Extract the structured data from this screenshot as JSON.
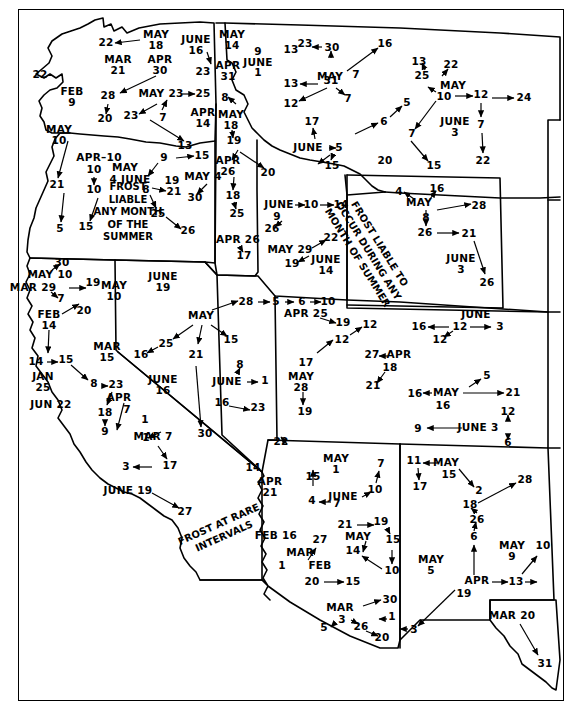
{
  "colors": {
    "ink": "#000000",
    "paper": "#ffffff"
  },
  "notes": {
    "frost_liable_block": "FROST\nLIABLE\nANY MONTH\nOF THE\nSUMMER",
    "frost_liable_rotated": "FROST LIABLE TO\nOCCUR DURING ANY\nMONTH OF SUMMER",
    "frost_rare_rotated": "FROST AT RARE\nINTERVALS"
  },
  "annotations": [
    {
      "id": "a001",
      "text": "22",
      "x": 106,
      "y": 43
    },
    {
      "id": "a002",
      "text": "MAY\n18",
      "x": 156,
      "y": 40
    },
    {
      "id": "a003",
      "text": "JUNE\n16",
      "x": 196,
      "y": 45
    },
    {
      "id": "a004",
      "text": "23",
      "x": 203,
      "y": 72
    },
    {
      "id": "a005",
      "text": "MAY\n14",
      "x": 232,
      "y": 40
    },
    {
      "id": "a006",
      "text": "APR\n31",
      "x": 228,
      "y": 71
    },
    {
      "id": "a007",
      "text": "9\nJUNE\n1",
      "x": 258,
      "y": 62
    },
    {
      "id": "a008",
      "text": "MAR\n21",
      "x": 118,
      "y": 65
    },
    {
      "id": "a009",
      "text": "APR\n30",
      "x": 160,
      "y": 65
    },
    {
      "id": "a010",
      "text": "22",
      "x": 40,
      "y": 75
    },
    {
      "id": "a011",
      "text": "FEB\n9",
      "x": 72,
      "y": 97
    },
    {
      "id": "a012",
      "text": "28",
      "x": 108,
      "y": 96
    },
    {
      "id": "a013",
      "text": "MAY 23",
      "x": 161,
      "y": 94
    },
    {
      "id": "a014",
      "text": "25",
      "x": 203,
      "y": 94
    },
    {
      "id": "a015",
      "text": "20",
      "x": 105,
      "y": 119
    },
    {
      "id": "a016",
      "text": "23",
      "x": 131,
      "y": 116
    },
    {
      "id": "a017",
      "text": "7",
      "x": 163,
      "y": 118
    },
    {
      "id": "a018",
      "text": "APR\n14",
      "x": 203,
      "y": 118
    },
    {
      "id": "a019",
      "text": "MAY\n10",
      "x": 59,
      "y": 135
    },
    {
      "id": "a020",
      "text": "13",
      "x": 185,
      "y": 146
    },
    {
      "id": "a021",
      "text": "APR–10",
      "x": 99,
      "y": 158
    },
    {
      "id": "a022",
      "text": "10",
      "x": 94,
      "y": 170
    },
    {
      "id": "a023",
      "text": "10",
      "x": 94,
      "y": 190
    },
    {
      "id": "a024",
      "text": "15",
      "x": 86,
      "y": 227
    },
    {
      "id": "a025",
      "text": "21",
      "x": 57,
      "y": 185
    },
    {
      "id": "a026",
      "text": "5",
      "x": 60,
      "y": 229
    },
    {
      "id": "a027",
      "text": "MAY",
      "x": 125,
      "y": 168
    },
    {
      "id": "a028",
      "text": "4 JUNE",
      "x": 130,
      "y": 180
    },
    {
      "id": "a029",
      "text": "9",
      "x": 164,
      "y": 158
    },
    {
      "id": "a030",
      "text": "15",
      "x": 202,
      "y": 156
    },
    {
      "id": "a031",
      "text": "8",
      "x": 146,
      "y": 190
    },
    {
      "id": "a032",
      "text": "19",
      "x": 172,
      "y": 181
    },
    {
      "id": "a033",
      "text": "21",
      "x": 174,
      "y": 192
    },
    {
      "id": "a034",
      "text": "MAY 4",
      "x": 203,
      "y": 177
    },
    {
      "id": "a035",
      "text": "30",
      "x": 195,
      "y": 198
    },
    {
      "id": "a036",
      "text": "25",
      "x": 158,
      "y": 214
    },
    {
      "id": "a037",
      "text": "26",
      "x": 188,
      "y": 231
    },
    {
      "id": "a038",
      "text": "8",
      "x": 225,
      "y": 98
    },
    {
      "id": "a039",
      "text": "MAY\n18",
      "x": 231,
      "y": 120
    },
    {
      "id": "a040",
      "text": "19",
      "x": 234,
      "y": 141
    },
    {
      "id": "a041",
      "text": "APR\n26",
      "x": 228,
      "y": 166
    },
    {
      "id": "a042",
      "text": "20",
      "x": 268,
      "y": 173
    },
    {
      "id": "a043",
      "text": "18",
      "x": 233,
      "y": 196
    },
    {
      "id": "a044",
      "text": "25",
      "x": 237,
      "y": 214
    },
    {
      "id": "a045",
      "text": "APR 26",
      "x": 238,
      "y": 240
    },
    {
      "id": "a046",
      "text": "17",
      "x": 244,
      "y": 256
    },
    {
      "id": "a047",
      "text": "JUNE",
      "x": 279,
      "y": 205
    },
    {
      "id": "a048",
      "text": "10",
      "x": 311,
      "y": 205
    },
    {
      "id": "a049",
      "text": "14",
      "x": 341,
      "y": 205
    },
    {
      "id": "a050",
      "text": "9",
      "x": 277,
      "y": 217
    },
    {
      "id": "a051",
      "text": "26",
      "x": 272,
      "y": 229
    },
    {
      "id": "a052",
      "text": "MAY 29",
      "x": 290,
      "y": 250
    },
    {
      "id": "a053",
      "text": "22",
      "x": 331,
      "y": 238
    },
    {
      "id": "a054",
      "text": "19",
      "x": 292,
      "y": 264
    },
    {
      "id": "a055",
      "text": "JUNE\n14",
      "x": 326,
      "y": 265
    },
    {
      "id": "a056",
      "text": "23",
      "x": 305,
      "y": 44
    },
    {
      "id": "a057",
      "text": "13",
      "x": 291,
      "y": 50
    },
    {
      "id": "a058",
      "text": "30",
      "x": 332,
      "y": 48
    },
    {
      "id": "a059",
      "text": "16",
      "x": 385,
      "y": 44
    },
    {
      "id": "a060",
      "text": "MAY",
      "x": 330,
      "y": 77
    },
    {
      "id": "a061",
      "text": "7",
      "x": 356,
      "y": 75
    },
    {
      "id": "a062",
      "text": "13",
      "x": 291,
      "y": 84
    },
    {
      "id": "a063",
      "text": "31",
      "x": 331,
      "y": 81
    },
    {
      "id": "a064",
      "text": "12",
      "x": 291,
      "y": 104
    },
    {
      "id": "a065",
      "text": "7",
      "x": 348,
      "y": 99
    },
    {
      "id": "a066",
      "text": "17",
      "x": 312,
      "y": 122
    },
    {
      "id": "a067",
      "text": "JUNE",
      "x": 308,
      "y": 148
    },
    {
      "id": "a068",
      "text": "5",
      "x": 339,
      "y": 148
    },
    {
      "id": "a069",
      "text": "15",
      "x": 332,
      "y": 166
    },
    {
      "id": "a070",
      "text": "6",
      "x": 384,
      "y": 122
    },
    {
      "id": "a071",
      "text": "5",
      "x": 407,
      "y": 103
    },
    {
      "id": "a072",
      "text": "20",
      "x": 385,
      "y": 161
    },
    {
      "id": "a073",
      "text": "13",
      "x": 419,
      "y": 62
    },
    {
      "id": "a074",
      "text": "25",
      "x": 422,
      "y": 76
    },
    {
      "id": "a075",
      "text": "22",
      "x": 451,
      "y": 65
    },
    {
      "id": "a076",
      "text": "MAY",
      "x": 453,
      "y": 86
    },
    {
      "id": "a077",
      "text": "10",
      "x": 444,
      "y": 97
    },
    {
      "id": "a078",
      "text": "12",
      "x": 481,
      "y": 95
    },
    {
      "id": "a079",
      "text": "24",
      "x": 524,
      "y": 98
    },
    {
      "id": "a080",
      "text": "7",
      "x": 412,
      "y": 134
    },
    {
      "id": "a081",
      "text": "JUNE\n3",
      "x": 455,
      "y": 127
    },
    {
      "id": "a082",
      "text": "7",
      "x": 481,
      "y": 125
    },
    {
      "id": "a083",
      "text": "15",
      "x": 434,
      "y": 166
    },
    {
      "id": "a084",
      "text": "22",
      "x": 483,
      "y": 161
    },
    {
      "id": "a085",
      "text": "4",
      "x": 399,
      "y": 192
    },
    {
      "id": "a086",
      "text": "16",
      "x": 437,
      "y": 189
    },
    {
      "id": "a087",
      "text": "MAY",
      "x": 419,
      "y": 203
    },
    {
      "id": "a088",
      "text": "28",
      "x": 479,
      "y": 206
    },
    {
      "id": "a089",
      "text": "8",
      "x": 426,
      "y": 218
    },
    {
      "id": "a090",
      "text": "26",
      "x": 425,
      "y": 233
    },
    {
      "id": "a091",
      "text": "21",
      "x": 469,
      "y": 234
    },
    {
      "id": "a092",
      "text": "JUNE\n3",
      "x": 461,
      "y": 264
    },
    {
      "id": "a093",
      "text": "26",
      "x": 487,
      "y": 283
    },
    {
      "id": "a094",
      "text": "JUNE\n19",
      "x": 163,
      "y": 282
    },
    {
      "id": "a095",
      "text": "30",
      "x": 62,
      "y": 263
    },
    {
      "id": "a096",
      "text": "MAY 10",
      "x": 50,
      "y": 275
    },
    {
      "id": "a097",
      "text": "MAR 29",
      "x": 33,
      "y": 288
    },
    {
      "id": "a098",
      "text": "19",
      "x": 93,
      "y": 283
    },
    {
      "id": "a099",
      "text": "MAY\n10",
      "x": 114,
      "y": 291
    },
    {
      "id": "a100",
      "text": "7",
      "x": 61,
      "y": 299
    },
    {
      "id": "a101",
      "text": "20",
      "x": 84,
      "y": 311
    },
    {
      "id": "a102",
      "text": "FEB\n14",
      "x": 49,
      "y": 320
    },
    {
      "id": "a103",
      "text": "14",
      "x": 36,
      "y": 362
    },
    {
      "id": "a104",
      "text": "15",
      "x": 66,
      "y": 360
    },
    {
      "id": "a105",
      "text": "JAN\n25",
      "x": 43,
      "y": 382
    },
    {
      "id": "a106",
      "text": "8",
      "x": 94,
      "y": 384
    },
    {
      "id": "a107",
      "text": "23",
      "x": 116,
      "y": 385
    },
    {
      "id": "a108",
      "text": "JUN 22",
      "x": 51,
      "y": 405
    },
    {
      "id": "a109",
      "text": "APR",
      "x": 119,
      "y": 398
    },
    {
      "id": "a110",
      "text": "18",
      "x": 105,
      "y": 413
    },
    {
      "id": "a111",
      "text": "9",
      "x": 105,
      "y": 432
    },
    {
      "id": "a112",
      "text": "7",
      "x": 127,
      "y": 410
    },
    {
      "id": "a113",
      "text": "1",
      "x": 146,
      "y": 438
    },
    {
      "id": "a114",
      "text": "1",
      "x": 145,
      "y": 420
    },
    {
      "id": "a115",
      "text": "MAR 7",
      "x": 153,
      "y": 437
    },
    {
      "id": "a116",
      "text": "17",
      "x": 170,
      "y": 466
    },
    {
      "id": "a117",
      "text": "3",
      "x": 126,
      "y": 467
    },
    {
      "id": "a118",
      "text": "MAR\n15",
      "x": 107,
      "y": 352
    },
    {
      "id": "a119",
      "text": "JUNE 19",
      "x": 128,
      "y": 491
    },
    {
      "id": "a120",
      "text": "27",
      "x": 185,
      "y": 512
    },
    {
      "id": "a121",
      "text": "MAY",
      "x": 201,
      "y": 316
    },
    {
      "id": "a122",
      "text": "28",
      "x": 246,
      "y": 302
    },
    {
      "id": "a123",
      "text": "25",
      "x": 166,
      "y": 344
    },
    {
      "id": "a124",
      "text": "16",
      "x": 141,
      "y": 355
    },
    {
      "id": "a125",
      "text": "21",
      "x": 196,
      "y": 355
    },
    {
      "id": "a126",
      "text": "15",
      "x": 231,
      "y": 340
    },
    {
      "id": "a127",
      "text": "JUNE\n16",
      "x": 163,
      "y": 385
    },
    {
      "id": "a128",
      "text": "8",
      "x": 240,
      "y": 365
    },
    {
      "id": "a129",
      "text": "JUNE",
      "x": 227,
      "y": 382
    },
    {
      "id": "a130",
      "text": "1",
      "x": 265,
      "y": 381
    },
    {
      "id": "a131",
      "text": "16",
      "x": 222,
      "y": 403
    },
    {
      "id": "a132",
      "text": "23",
      "x": 258,
      "y": 408
    },
    {
      "id": "a133",
      "text": "30",
      "x": 205,
      "y": 434
    },
    {
      "id": "a134",
      "text": "22",
      "x": 281,
      "y": 442
    },
    {
      "id": "a135",
      "text": "5",
      "x": 276,
      "y": 302
    },
    {
      "id": "a136",
      "text": "6",
      "x": 302,
      "y": 302
    },
    {
      "id": "a137",
      "text": "10",
      "x": 328,
      "y": 302
    },
    {
      "id": "a138",
      "text": "APR 25",
      "x": 306,
      "y": 314
    },
    {
      "id": "a139",
      "text": "19",
      "x": 343,
      "y": 323
    },
    {
      "id": "a140",
      "text": "12",
      "x": 370,
      "y": 325
    },
    {
      "id": "a141",
      "text": "12",
      "x": 342,
      "y": 340
    },
    {
      "id": "a142",
      "text": "17",
      "x": 306,
      "y": 363
    },
    {
      "id": "a143",
      "text": "MAY\n28",
      "x": 301,
      "y": 382
    },
    {
      "id": "a144",
      "text": "19",
      "x": 305,
      "y": 412
    },
    {
      "id": "a145",
      "text": "27",
      "x": 372,
      "y": 355
    },
    {
      "id": "a146",
      "text": "APR",
      "x": 399,
      "y": 355
    },
    {
      "id": "a147",
      "text": "18",
      "x": 390,
      "y": 368
    },
    {
      "id": "a148",
      "text": "21",
      "x": 373,
      "y": 386
    },
    {
      "id": "a149",
      "text": "JUNE",
      "x": 476,
      "y": 315
    },
    {
      "id": "a150",
      "text": "16",
      "x": 419,
      "y": 327
    },
    {
      "id": "a151",
      "text": "12",
      "x": 460,
      "y": 327
    },
    {
      "id": "a152",
      "text": "3",
      "x": 500,
      "y": 327
    },
    {
      "id": "a153",
      "text": "12",
      "x": 440,
      "y": 340
    },
    {
      "id": "a154",
      "text": "5",
      "x": 487,
      "y": 376
    },
    {
      "id": "a155",
      "text": "16",
      "x": 415,
      "y": 394
    },
    {
      "id": "a156",
      "text": "MAY",
      "x": 446,
      "y": 393
    },
    {
      "id": "a157",
      "text": "21",
      "x": 513,
      "y": 393
    },
    {
      "id": "a158",
      "text": "16",
      "x": 443,
      "y": 406
    },
    {
      "id": "a159",
      "text": "12",
      "x": 508,
      "y": 412
    },
    {
      "id": "a160",
      "text": "9",
      "x": 418,
      "y": 429
    },
    {
      "id": "a161",
      "text": "JUNE 3",
      "x": 478,
      "y": 428
    },
    {
      "id": "a162",
      "text": "6",
      "x": 508,
      "y": 443
    },
    {
      "id": "a163",
      "text": "14",
      "x": 253,
      "y": 468
    },
    {
      "id": "a164",
      "text": "APR\n21",
      "x": 270,
      "y": 487
    },
    {
      "id": "a165",
      "text": "FEB 16",
      "x": 276,
      "y": 536
    },
    {
      "id": "a166",
      "text": "MAY\n1",
      "x": 336,
      "y": 464
    },
    {
      "id": "a167",
      "text": "15",
      "x": 313,
      "y": 477
    },
    {
      "id": "a168",
      "text": "7",
      "x": 381,
      "y": 464
    },
    {
      "id": "a169",
      "text": "10",
      "x": 375,
      "y": 490
    },
    {
      "id": "a170",
      "text": "JUNE",
      "x": 343,
      "y": 497
    },
    {
      "id": "a171",
      "text": "4",
      "x": 312,
      "y": 501
    },
    {
      "id": "a172",
      "text": "7",
      "x": 337,
      "y": 504
    },
    {
      "id": "a173",
      "text": "21",
      "x": 345,
      "y": 525
    },
    {
      "id": "a174",
      "text": "19",
      "x": 381,
      "y": 522
    },
    {
      "id": "a175",
      "text": "MAY",
      "x": 358,
      "y": 537
    },
    {
      "id": "a176",
      "text": "15",
      "x": 393,
      "y": 540
    },
    {
      "id": "a177",
      "text": "14",
      "x": 353,
      "y": 551
    },
    {
      "id": "a178",
      "text": "10",
      "x": 392,
      "y": 571
    },
    {
      "id": "a179",
      "text": "27",
      "x": 320,
      "y": 540
    },
    {
      "id": "a180",
      "text": "MAR",
      "x": 300,
      "y": 553
    },
    {
      "id": "a181",
      "text": "1",
      "x": 282,
      "y": 566
    },
    {
      "id": "a182",
      "text": "FEB",
      "x": 320,
      "y": 566
    },
    {
      "id": "a183",
      "text": "20",
      "x": 312,
      "y": 582
    },
    {
      "id": "a184",
      "text": "15",
      "x": 353,
      "y": 582
    },
    {
      "id": "a185",
      "text": "MAR",
      "x": 340,
      "y": 608
    },
    {
      "id": "a186",
      "text": "30",
      "x": 390,
      "y": 600
    },
    {
      "id": "a187",
      "text": "3",
      "x": 342,
      "y": 620
    },
    {
      "id": "a188",
      "text": "5",
      "x": 324,
      "y": 628
    },
    {
      "id": "a189",
      "text": "26",
      "x": 361,
      "y": 627
    },
    {
      "id": "a190",
      "text": "20",
      "x": 382,
      "y": 638
    },
    {
      "id": "a191",
      "text": "1",
      "x": 392,
      "y": 617
    },
    {
      "id": "a192",
      "text": "3",
      "x": 414,
      "y": 630
    },
    {
      "id": "a193",
      "text": "MAY",
      "x": 446,
      "y": 463
    },
    {
      "id": "a194",
      "text": "11",
      "x": 414,
      "y": 461
    },
    {
      "id": "a195",
      "text": "15",
      "x": 449,
      "y": 475
    },
    {
      "id": "a196",
      "text": "17",
      "x": 420,
      "y": 487
    },
    {
      "id": "a197",
      "text": "2",
      "x": 479,
      "y": 491
    },
    {
      "id": "a198",
      "text": "28",
      "x": 525,
      "y": 480
    },
    {
      "id": "a199",
      "text": "18",
      "x": 470,
      "y": 505
    },
    {
      "id": "a200",
      "text": "26",
      "x": 477,
      "y": 520
    },
    {
      "id": "a201",
      "text": "6",
      "x": 474,
      "y": 537
    },
    {
      "id": "a202",
      "text": "MAY\n9",
      "x": 512,
      "y": 551
    },
    {
      "id": "a203",
      "text": "10",
      "x": 543,
      "y": 546
    },
    {
      "id": "a204",
      "text": "MAY\n5",
      "x": 431,
      "y": 565
    },
    {
      "id": "a205",
      "text": "APR",
      "x": 477,
      "y": 581
    },
    {
      "id": "a206",
      "text": "13",
      "x": 516,
      "y": 582
    },
    {
      "id": "a207",
      "text": "19",
      "x": 464,
      "y": 594
    },
    {
      "id": "a208",
      "text": "MAR 20",
      "x": 512,
      "y": 616
    },
    {
      "id": "a209",
      "text": "31",
      "x": 545,
      "y": 664
    }
  ]
}
